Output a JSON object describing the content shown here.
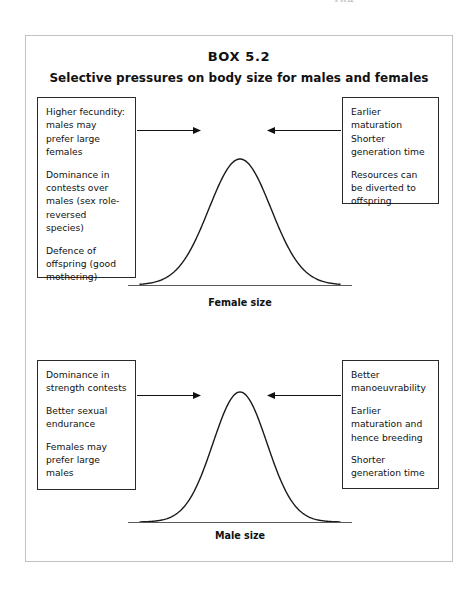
{
  "page": {
    "page_number_fragment": "184"
  },
  "figure": {
    "box_number": "BOX 5.2",
    "title": "Selective pressures on body size for males and females",
    "border_color": "#c2c2c2"
  },
  "panels": [
    {
      "id": "female",
      "axis_label": "Female size",
      "left_callout": {
        "name": "female-left-pressures",
        "paragraphs": [
          "Higher fecundity: males may prefer large females",
          "Dominance in contests over males (sex role-reversed species)",
          "Defence of offspring (good mothering)"
        ]
      },
      "right_callout": {
        "name": "female-right-pressures",
        "paragraphs": [
          "Earlier maturation Shorter generation time",
          "Resources can be diverted to offspring"
        ]
      },
      "left_arrow_direction": "right",
      "right_arrow_direction": "left"
    },
    {
      "id": "male",
      "axis_label": "Male size",
      "left_callout": {
        "name": "male-left-pressures",
        "paragraphs": [
          "Dominance in strength contests",
          "Better sexual endurance",
          "Females may prefer large males"
        ]
      },
      "right_callout": {
        "name": "male-right-pressures",
        "paragraphs": [
          "Better manoeuvrability",
          "Earlier maturation and hence breeding",
          "Shorter generation time"
        ]
      },
      "left_arrow_direction": "right",
      "right_arrow_direction": "left"
    }
  ],
  "chart_data": {
    "type": "line",
    "title": "Selective pressures on body size for males and females",
    "grid": false,
    "legend": "none",
    "ylabel": "Frequency",
    "series": [
      {
        "name": "Female size distribution",
        "xlabel": "Female size",
        "distribution": "normal",
        "mean": 0.5,
        "relative_sd": 0.155,
        "peak_height": 1.0,
        "curve_width_px": 200,
        "curve_height_px": 126,
        "x": [
          0.0,
          0.05,
          0.1,
          0.15,
          0.2,
          0.25,
          0.3,
          0.35,
          0.4,
          0.45,
          0.5,
          0.55,
          0.6,
          0.65,
          0.7,
          0.75,
          0.8,
          0.85,
          0.9,
          0.95,
          1.0
        ],
        "y": [
          0.01,
          0.02,
          0.04,
          0.08,
          0.16,
          0.27,
          0.42,
          0.59,
          0.77,
          0.93,
          1.0,
          0.93,
          0.77,
          0.59,
          0.42,
          0.27,
          0.16,
          0.08,
          0.04,
          0.02,
          0.01
        ]
      },
      {
        "name": "Male size distribution",
        "xlabel": "Male size",
        "distribution": "normal",
        "mean": 0.5,
        "relative_sd": 0.135,
        "peak_height": 1.0,
        "curve_width_px": 200,
        "curve_height_px": 130,
        "x": [
          0.0,
          0.05,
          0.1,
          0.15,
          0.2,
          0.25,
          0.3,
          0.35,
          0.4,
          0.45,
          0.5,
          0.55,
          0.6,
          0.65,
          0.7,
          0.75,
          0.8,
          0.85,
          0.9,
          0.95,
          1.0
        ],
        "y": [
          0.0,
          0.01,
          0.02,
          0.05,
          0.11,
          0.21,
          0.36,
          0.55,
          0.74,
          0.92,
          1.0,
          0.92,
          0.74,
          0.55,
          0.36,
          0.21,
          0.11,
          0.05,
          0.02,
          0.01,
          0.0
        ]
      }
    ],
    "annotations": [
      {
        "panel": "female",
        "side": "left",
        "direction": "right",
        "text": "Higher fecundity: males may prefer large females / Dominance in contests over males (sex role-reversed species) / Defence of offspring (good mothering)"
      },
      {
        "panel": "female",
        "side": "right",
        "direction": "left",
        "text": "Earlier maturation Shorter generation time / Resources can be diverted to offspring"
      },
      {
        "panel": "male",
        "side": "left",
        "direction": "right",
        "text": "Dominance in strength contests / Better sexual endurance / Females may prefer large males"
      },
      {
        "panel": "male",
        "side": "right",
        "direction": "left",
        "text": "Better manoeuvrability / Earlier maturation and hence breeding / Shorter generation time"
      }
    ]
  }
}
